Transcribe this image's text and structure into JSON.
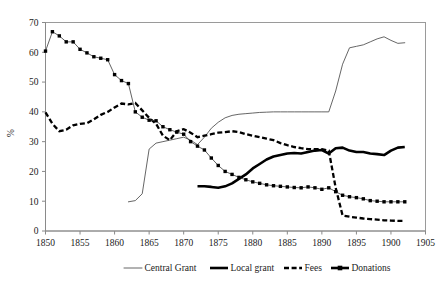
{
  "chart_data": {
    "type": "line",
    "title": "",
    "subtitle": "",
    "xlabel": "",
    "ylabel": "%",
    "xlim": [
      1850,
      1905
    ],
    "ylim": [
      0,
      70
    ],
    "ytick_step": 10,
    "xtick_step": 5,
    "grid": false,
    "legend_position": "bottom",
    "xticks": [
      "1850",
      "1855",
      "1860",
      "1865",
      "1870",
      "1875",
      "1880",
      "1885",
      "1890",
      "1895",
      "1900",
      "1905"
    ],
    "yticks": [
      "0",
      "10",
      "20",
      "30",
      "40",
      "50",
      "60",
      "70"
    ],
    "series": [
      {
        "name": "Central Grant",
        "style": "thin-solid",
        "color": "#555555",
        "x": [
          1862,
          1863,
          1864,
          1865,
          1866,
          1867,
          1868,
          1869,
          1870,
          1871,
          1872,
          1873,
          1874,
          1875,
          1876,
          1877,
          1878,
          1879,
          1880,
          1881,
          1882,
          1883,
          1884,
          1885,
          1886,
          1887,
          1888,
          1889,
          1890,
          1891,
          1892,
          1893,
          1894,
          1895,
          1896,
          1897,
          1898,
          1899,
          1900,
          1901,
          1902
        ],
        "values": [
          9.8,
          10.2,
          12.5,
          27.5,
          29.5,
          30.0,
          30.5,
          31.0,
          31.5,
          30.5,
          29.0,
          31.5,
          34.5,
          36.5,
          38.0,
          38.8,
          39.2,
          39.4,
          39.6,
          39.8,
          39.9,
          40.0,
          40.0,
          40.0,
          40.0,
          40.0,
          40.0,
          40.0,
          40.0,
          40.0,
          47.0,
          56.0,
          61.5,
          62.0,
          62.5,
          63.5,
          64.5,
          65.2,
          64.0,
          63.0,
          63.2
        ]
      },
      {
        "name": "Local grant",
        "style": "thick-solid",
        "color": "#000000",
        "x": [
          1872,
          1873,
          1874,
          1875,
          1876,
          1877,
          1878,
          1879,
          1880,
          1881,
          1882,
          1883,
          1884,
          1885,
          1886,
          1887,
          1888,
          1889,
          1890,
          1891,
          1892,
          1893,
          1894,
          1895,
          1896,
          1897,
          1898,
          1899,
          1900,
          1901,
          1902
        ],
        "values": [
          15.0,
          15.0,
          14.8,
          14.5,
          15.0,
          16.0,
          17.5,
          19.0,
          21.0,
          22.5,
          24.0,
          25.0,
          25.5,
          26.0,
          26.2,
          26.0,
          26.5,
          27.0,
          27.2,
          26.0,
          27.8,
          28.0,
          27.0,
          26.5,
          26.5,
          26.0,
          25.8,
          25.5,
          27.0,
          28.0,
          28.2
        ]
      },
      {
        "name": "Fees",
        "style": "dashed",
        "color": "#000000",
        "x": [
          1850,
          1851,
          1852,
          1853,
          1854,
          1855,
          1856,
          1857,
          1858,
          1859,
          1860,
          1861,
          1862,
          1863,
          1864,
          1865,
          1866,
          1867,
          1868,
          1869,
          1870,
          1871,
          1872,
          1873,
          1874,
          1875,
          1876,
          1877,
          1878,
          1879,
          1880,
          1881,
          1882,
          1883,
          1884,
          1885,
          1886,
          1887,
          1888,
          1889,
          1890,
          1891,
          1892,
          1893,
          1894,
          1895,
          1896,
          1897,
          1898,
          1899,
          1900,
          1901,
          1902
        ],
        "values": [
          39.8,
          36.0,
          33.5,
          34.0,
          35.5,
          36.0,
          36.2,
          37.5,
          39.0,
          40.0,
          41.5,
          42.8,
          42.5,
          43.0,
          40.5,
          38.0,
          36.0,
          32.0,
          30.5,
          33.5,
          34.2,
          33.0,
          31.5,
          32.0,
          32.5,
          33.0,
          33.2,
          33.5,
          33.2,
          32.5,
          32.0,
          31.5,
          31.0,
          30.5,
          29.5,
          28.8,
          28.2,
          27.8,
          27.5,
          27.5,
          27.5,
          27.0,
          14.5,
          5.2,
          4.8,
          4.5,
          4.2,
          4.0,
          3.8,
          3.6,
          3.5,
          3.4,
          3.4
        ]
      },
      {
        "name": "Donations",
        "style": "square-markers",
        "color": "#000000",
        "x": [
          1850,
          1851,
          1852,
          1853,
          1854,
          1855,
          1856,
          1857,
          1858,
          1859,
          1860,
          1861,
          1862,
          1863,
          1864,
          1865,
          1866,
          1867,
          1868,
          1869,
          1870,
          1871,
          1872,
          1873,
          1874,
          1875,
          1876,
          1877,
          1878,
          1879,
          1880,
          1881,
          1882,
          1883,
          1884,
          1885,
          1886,
          1887,
          1888,
          1889,
          1890,
          1891,
          1892,
          1893,
          1894,
          1895,
          1896,
          1897,
          1898,
          1899,
          1900,
          1901,
          1902
        ],
        "values": [
          60.4,
          66.9,
          65.5,
          63.5,
          63.5,
          61.0,
          59.8,
          58.5,
          58.0,
          57.5,
          52.5,
          50.5,
          49.5,
          40.0,
          38.2,
          37.2,
          37.0,
          35.0,
          34.0,
          33.2,
          32.5,
          30.0,
          28.5,
          27.2,
          24.5,
          22.0,
          20.0,
          19.0,
          18.0,
          17.2,
          16.5,
          16.0,
          15.5,
          15.2,
          15.0,
          14.8,
          14.6,
          14.5,
          14.8,
          14.5,
          14.0,
          14.5,
          13.2,
          12.0,
          11.5,
          11.2,
          10.8,
          10.2,
          10.0,
          9.8,
          9.8,
          9.8,
          9.8
        ]
      }
    ]
  },
  "legend": {
    "items": [
      {
        "label": "Central Grant",
        "swatch": "thin-line-swatch"
      },
      {
        "label": "Local grant",
        "swatch": "thick-line-swatch"
      },
      {
        "label": "Fees",
        "swatch": "dashed-line-swatch"
      },
      {
        "label": "Donations",
        "swatch": "square-marker-swatch"
      }
    ]
  }
}
